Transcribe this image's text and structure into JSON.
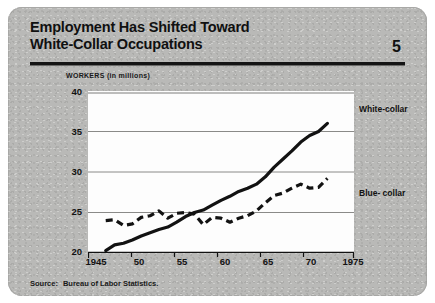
{
  "card": {
    "title_line1": "Employment Has Shifted Toward",
    "title_line2": "White-Collar Occupations",
    "page_number": "5",
    "axis_note": "WORKERS  (in millions)",
    "source_label": "Source:",
    "source_text": "Bureau of Labor Statistics."
  },
  "legend": {
    "white_collar": "White-collar",
    "blue_collar": "Blue- collar"
  },
  "colors": {
    "card_background": "#b9b9b7",
    "plot_background": "#fdfdfd",
    "ink": "#121212",
    "gridline": "#8a8a88",
    "rule": "#141414"
  },
  "chart_data": {
    "type": "line",
    "title": "Employment Has Shifted Toward White-Collar Occupations",
    "subtitle": "",
    "xlabel": "",
    "ylabel": "WORKERS  (in millions)",
    "xlim": [
      1945,
      1975
    ],
    "ylim": [
      20,
      40
    ],
    "xticks": [
      1945,
      1950,
      1955,
      1960,
      1965,
      1970,
      1975
    ],
    "xticklabels": [
      "1945",
      "50",
      "55",
      "60",
      "65",
      "70",
      "1975"
    ],
    "yticks": [
      20,
      25,
      30,
      35,
      40
    ],
    "yticklabels": [
      "20",
      "25",
      "30",
      "35",
      "40"
    ],
    "grid": "horizontal",
    "legend_position": "right-inline",
    "series": [
      {
        "name": "White-collar",
        "style": "solid",
        "x": [
          1947,
          1948,
          1949,
          1950,
          1951,
          1952,
          1953,
          1954,
          1955,
          1956,
          1957,
          1958,
          1959,
          1960,
          1961,
          1962,
          1963,
          1964,
          1965,
          1966,
          1967,
          1968,
          1969,
          1970,
          1971,
          1972
        ],
        "values": [
          20.3,
          21.0,
          21.2,
          21.6,
          22.1,
          22.5,
          22.9,
          23.2,
          23.8,
          24.5,
          25.0,
          25.3,
          25.9,
          26.5,
          27.0,
          27.6,
          28.0,
          28.5,
          29.4,
          30.6,
          31.6,
          32.6,
          33.7,
          34.5,
          35.0,
          36.0
        ],
        "annotations": [
          {
            "x": 1971.5,
            "y": 35.6,
            "text": "segment steepens sharply after 1965"
          }
        ]
      },
      {
        "name": "Blue- collar",
        "style": "dashed",
        "x": [
          1947,
          1948,
          1949,
          1950,
          1951,
          1952,
          1953,
          1954,
          1955,
          1956,
          1957,
          1958,
          1959,
          1960,
          1961,
          1962,
          1963,
          1964,
          1965,
          1966,
          1967,
          1968,
          1969,
          1970,
          1971,
          1972
        ],
        "values": [
          24.0,
          24.1,
          23.4,
          23.6,
          24.4,
          24.6,
          25.2,
          24.3,
          24.9,
          25.0,
          24.8,
          23.5,
          24.4,
          24.3,
          23.8,
          24.3,
          24.6,
          25.2,
          26.2,
          27.1,
          27.4,
          28.0,
          28.5,
          28.0,
          28.1,
          29.2
        ]
      }
    ],
    "crossover": {
      "approx_year": 1956,
      "approx_value": 24.6
    }
  }
}
